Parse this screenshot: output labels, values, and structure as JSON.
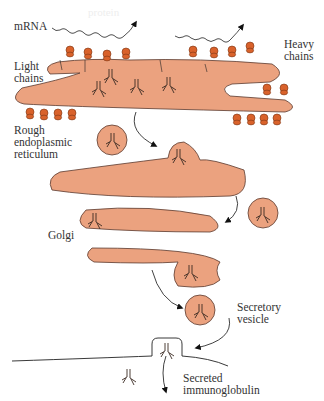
{
  "figure": {
    "colors": {
      "organelle_fill": "#EBA27F",
      "organelle_stroke": "#5a3a2e",
      "ribosome_fill": "#D9622B",
      "line": "#222222",
      "text": "#333333"
    },
    "labels": {
      "mrna": "mRNA",
      "light_chains": "Light\nchains",
      "heavy_chains": "Heavy\nchains",
      "rer": "Rough\nendoplasmic\nreticulum",
      "golgi": "Golgi",
      "secretory_vesicle": "Secretory\nvesicle",
      "secreted_ig": "Secreted\nimmunoglobulin"
    },
    "faint_text": "protein"
  }
}
